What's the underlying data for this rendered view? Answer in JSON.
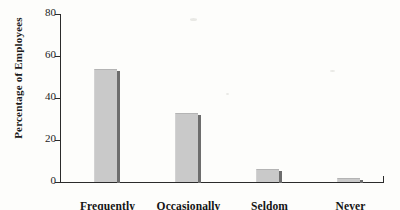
{
  "chart_data": {
    "type": "bar",
    "title": "",
    "subtitle": "",
    "xlabel": "",
    "ylabel": "Percentage of Employees",
    "categories": [
      "Frequently",
      "Occasionally",
      "Seldom",
      "Never"
    ],
    "values": [
      54,
      33,
      6,
      2
    ],
    "ylim": [
      0,
      80
    ],
    "yticks": [
      0,
      20,
      40,
      60,
      80
    ],
    "ytick_labels": [
      "0",
      "20",
      "40",
      "60",
      "80"
    ],
    "xticks": [],
    "grid": false,
    "legend": null,
    "annotations": [],
    "series": [
      {
        "name": "Percentage of Employees",
        "values": [
          54,
          33,
          6,
          2
        ]
      }
    ]
  },
  "style": {
    "bar_fill": "#c9c9c9",
    "bar_shadow": "#6d6d6d",
    "axis_color": "#2b2b2b",
    "text_color": "#141414",
    "background": "#fdfdfb"
  }
}
